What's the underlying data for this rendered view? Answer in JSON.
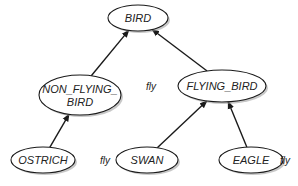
{
  "diagram": {
    "type": "inheritance-tree",
    "colors": {
      "stroke": "#1a1a1a",
      "fill": "#ffffff",
      "shadow": "#9a9a9a",
      "text": "#222222"
    },
    "nodes": [
      {
        "id": "bird",
        "label": "BIRD",
        "lines": [
          "BIRD"
        ],
        "cx": 138,
        "cy": 18,
        "rx": 30,
        "ry": 13
      },
      {
        "id": "non_flying_bird",
        "label": "NON_FLYING_BIRD",
        "lines": [
          "NON_FLYING_",
          "BIRD"
        ],
        "cx": 80,
        "cy": 95,
        "rx": 41,
        "ry": 20
      },
      {
        "id": "flying_bird",
        "label": "FLYING_BIRD",
        "lines": [
          "FLYING_BIRD"
        ],
        "cx": 222,
        "cy": 86,
        "rx": 44,
        "ry": 16
      },
      {
        "id": "ostrich",
        "label": "OSTRICH",
        "lines": [
          "OSTRICH"
        ],
        "cx": 43,
        "cy": 160,
        "rx": 32,
        "ry": 13
      },
      {
        "id": "swan",
        "label": "SWAN",
        "lines": [
          "SWAN"
        ],
        "cx": 147,
        "cy": 160,
        "rx": 31,
        "ry": 13
      },
      {
        "id": "eagle",
        "label": "EAGLE",
        "lines": [
          "EAGLE"
        ],
        "cx": 251,
        "cy": 160,
        "rx": 32,
        "ry": 13
      }
    ],
    "edges": [
      {
        "from": "non_flying_bird",
        "to": "bird"
      },
      {
        "from": "flying_bird",
        "to": "bird"
      },
      {
        "from": "ostrich",
        "to": "non_flying_bird"
      },
      {
        "from": "swan",
        "to": "flying_bird"
      },
      {
        "from": "eagle",
        "to": "flying_bird"
      }
    ],
    "annotations": [
      {
        "node": "flying_bird",
        "text": "fly",
        "x": 146,
        "y": 90
      },
      {
        "node": "swan",
        "text": "fly",
        "x": 100,
        "y": 164
      },
      {
        "node": "eagle",
        "text": "fly",
        "x": 280,
        "y": 164
      }
    ]
  }
}
